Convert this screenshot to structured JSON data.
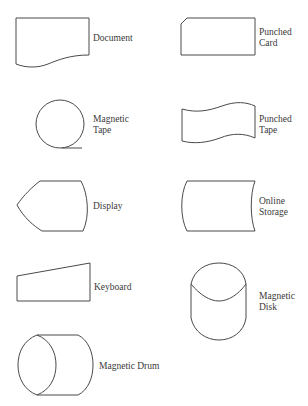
{
  "diagram": {
    "type": "flowchart-symbol-legend",
    "stroke_color": "#4a4a4a",
    "text_color": "#3a3a3a",
    "background": "#ffffff",
    "symbols": [
      {
        "id": "document",
        "label": "Document"
      },
      {
        "id": "punched-card",
        "label": "Punched\nCard"
      },
      {
        "id": "magnetic-tape",
        "label": "Magnetic\nTape"
      },
      {
        "id": "punched-tape",
        "label": "Punched\nTape"
      },
      {
        "id": "display",
        "label": "Display"
      },
      {
        "id": "online-storage",
        "label": "Online\nStorage"
      },
      {
        "id": "keyboard",
        "label": "Keyboard"
      },
      {
        "id": "magnetic-disk",
        "label": "Magnetic\nDisk"
      },
      {
        "id": "magnetic-drum",
        "label": "Magnetic Drum"
      }
    ]
  }
}
